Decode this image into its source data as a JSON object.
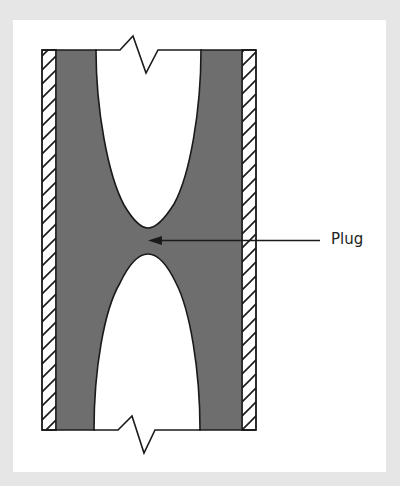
{
  "diagram": {
    "labels": {
      "plug": "Plug"
    },
    "colors": {
      "background": "#e6e6e6",
      "panel": "#ffffff",
      "fill": "#6e6e6e",
      "stroke": "#1a1a1a"
    },
    "elements": [
      {
        "id": "left-wall",
        "type": "hatched-wall"
      },
      {
        "id": "right-wall",
        "type": "hatched-wall"
      },
      {
        "id": "deposit",
        "type": "gray-fill"
      },
      {
        "id": "upper-void",
        "type": "open-bore"
      },
      {
        "id": "lower-void",
        "type": "open-bore"
      },
      {
        "id": "top-break",
        "type": "break-line"
      },
      {
        "id": "bottom-break",
        "type": "break-line"
      },
      {
        "id": "plug-arrow",
        "type": "leader-arrow",
        "target": "plug"
      }
    ]
  }
}
